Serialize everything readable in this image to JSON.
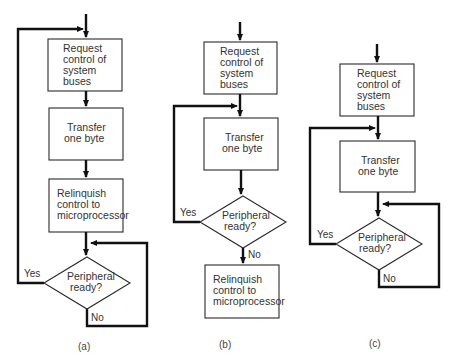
{
  "diagram": {
    "colors": {
      "line": "#111111",
      "box_border": "#2a2a2a",
      "text": "#333333",
      "background": "#ffffff"
    },
    "a": {
      "caption": "(a)",
      "step1": [
        "Request",
        "control of",
        "system",
        "buses"
      ],
      "step2": [
        "Transfer",
        "one byte"
      ],
      "step3": [
        "Relinquish",
        "control to",
        "microprocessor"
      ],
      "decision": [
        "Peripheral",
        "ready?"
      ],
      "yes": "Yes",
      "no": "No"
    },
    "b": {
      "caption": "(b)",
      "step1": [
        "Request",
        "control of",
        "system",
        "buses"
      ],
      "step2": [
        "Transfer",
        "one byte"
      ],
      "decision": [
        "Peripheral",
        "ready?"
      ],
      "step3": [
        "Relinquish",
        "control to",
        "microprocessor"
      ],
      "yes": "Yes",
      "no": "No"
    },
    "c": {
      "caption": "(c)",
      "step1": [
        "Request",
        "control of",
        "system",
        "buses"
      ],
      "step2": [
        "Transfer",
        "one byte"
      ],
      "decision": [
        "Peripheral",
        "ready?"
      ],
      "yes": "Yes",
      "no": "No"
    }
  }
}
